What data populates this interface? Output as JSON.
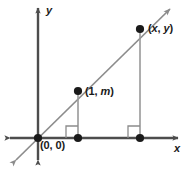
{
  "figure": {
    "name": "slope-coordinate-plane-diagram",
    "axes": {
      "x_label": "x",
      "y_label": "y",
      "x_axis_y": 138,
      "y_axis_x": 38
    },
    "colors": {
      "axis": "#4d4d4d",
      "line": "#8c8c8c",
      "point": "#1a1a1a",
      "right_angle": "#8c8c8c",
      "dropline": "#999999",
      "text": "#1a1a1a",
      "background": "#ffffff"
    },
    "points": [
      {
        "label": "(0, 0)",
        "label_plain": "(0, 0)",
        "x": 38,
        "y": 138
      },
      {
        "label": "(1, m)",
        "label_plain": "(1, m)",
        "x": 78,
        "y": 91
      },
      {
        "label": "(x, y)",
        "label_plain": "(x, y)",
        "x": 140,
        "y": 29
      }
    ],
    "foot_points": [
      {
        "x": 78,
        "y": 138
      },
      {
        "x": 140,
        "y": 138
      }
    ],
    "line": {
      "description": "line through origin with slope m",
      "from_x": 14,
      "from_y": 162,
      "to_x": 172,
      "to_y": 7
    },
    "right_angle_marks": [
      {
        "x": 78,
        "y": 138
      },
      {
        "x": 140,
        "y": 138
      }
    ]
  }
}
